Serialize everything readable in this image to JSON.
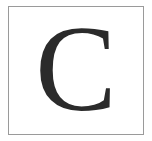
{
  "card": {
    "letter": "C",
    "border_color": "#9a9a9a",
    "letter_color": "#2b2b2b"
  }
}
